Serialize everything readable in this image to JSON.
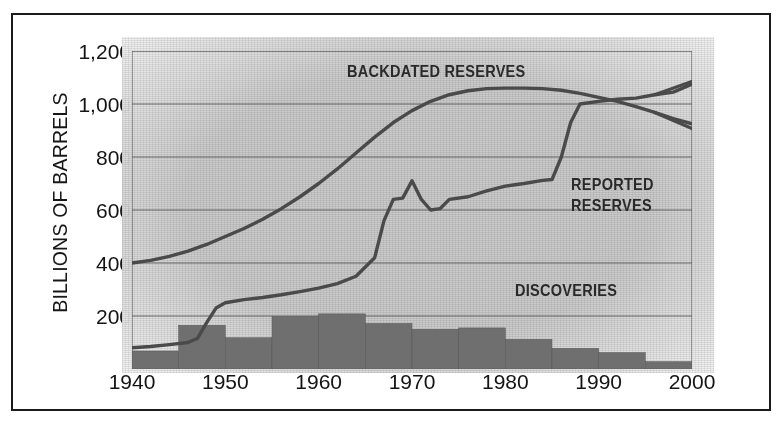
{
  "chart_data": {
    "type": "line",
    "title": "",
    "xlabel": "",
    "ylabel": "BILLIONS OF BARRELS",
    "xlim": [
      1940,
      2000
    ],
    "ylim": [
      0,
      1200
    ],
    "grid": true,
    "legend_position": "inline-annotations",
    "y_ticks": [
      {
        "value": 1200,
        "label": "1,200"
      },
      {
        "value": 1000,
        "label": "1,000"
      },
      {
        "value": 800,
        "label": "800"
      },
      {
        "value": 600,
        "label": "600"
      },
      {
        "value": 400,
        "label": "400"
      },
      {
        "value": 200,
        "label": "200"
      }
    ],
    "x_ticks": [
      {
        "value": 1940,
        "label": "1940"
      },
      {
        "value": 1950,
        "label": "1950"
      },
      {
        "value": 1960,
        "label": "1960"
      },
      {
        "value": 1970,
        "label": "1970"
      },
      {
        "value": 1980,
        "label": "1980"
      },
      {
        "value": 1990,
        "label": "1990"
      },
      {
        "value": 2000,
        "label": "2000"
      }
    ],
    "annotations": [
      {
        "name": "backdated-reserves-label",
        "text": "BACKDATED RESERVES",
        "x": 1963,
        "y": 1125
      },
      {
        "name": "reported-reserves-label-line1",
        "text": "REPORTED",
        "x": 1987,
        "y": 700
      },
      {
        "name": "reported-reserves-label-line2",
        "text": "RESERVES",
        "x": 1987,
        "y": 620
      },
      {
        "name": "discoveries-label",
        "text": "DISCOVERIES",
        "x": 1981,
        "y": 300
      }
    ],
    "series": [
      {
        "name": "BACKDATED RESERVES",
        "type": "line",
        "color": "#4a4a4a",
        "end_marker": "down-arrow",
        "x": [
          1940,
          1942,
          1944,
          1946,
          1948,
          1950,
          1952,
          1954,
          1956,
          1958,
          1960,
          1962,
          1964,
          1966,
          1968,
          1970,
          1972,
          1974,
          1976,
          1978,
          1980,
          1982,
          1984,
          1986,
          1988,
          1990,
          1992,
          1994,
          1996,
          1998,
          2000
        ],
        "y": [
          400,
          410,
          425,
          445,
          470,
          500,
          530,
          565,
          605,
          650,
          700,
          755,
          815,
          875,
          930,
          975,
          1010,
          1035,
          1050,
          1058,
          1060,
          1060,
          1058,
          1052,
          1040,
          1025,
          1010,
          990,
          968,
          945,
          925
        ]
      },
      {
        "name": "REPORTED RESERVES",
        "type": "line",
        "color": "#4a4a4a",
        "end_marker": "up-arrow",
        "x": [
          1940,
          1942,
          1944,
          1946,
          1947,
          1948,
          1949,
          1950,
          1952,
          1954,
          1956,
          1958,
          1960,
          1962,
          1964,
          1966,
          1967,
          1968,
          1969,
          1970,
          1971,
          1972,
          1973,
          1974,
          1976,
          1978,
          1980,
          1982,
          1984,
          1985,
          1986,
          1987,
          1988,
          1990,
          1992,
          1994,
          1996,
          1998,
          2000
        ],
        "y": [
          80,
          85,
          92,
          100,
          115,
          175,
          230,
          250,
          262,
          270,
          280,
          292,
          305,
          322,
          350,
          420,
          560,
          640,
          645,
          710,
          640,
          600,
          605,
          640,
          650,
          672,
          690,
          700,
          712,
          715,
          800,
          930,
          1000,
          1010,
          1018,
          1022,
          1035,
          1045,
          1075
        ]
      }
    ],
    "bars": {
      "name": "DISCOVERIES",
      "type": "bar",
      "color": "#6f6f6f",
      "bin_width_years": 5,
      "bins": [
        {
          "start": 1940,
          "end": 1945,
          "value": 68
        },
        {
          "start": 1945,
          "end": 1950,
          "value": 165
        },
        {
          "start": 1950,
          "end": 1955,
          "value": 118
        },
        {
          "start": 1955,
          "end": 1960,
          "value": 198
        },
        {
          "start": 1960,
          "end": 1965,
          "value": 208
        },
        {
          "start": 1965,
          "end": 1970,
          "value": 172
        },
        {
          "start": 1970,
          "end": 1975,
          "value": 150
        },
        {
          "start": 1975,
          "end": 1980,
          "value": 155
        },
        {
          "start": 1980,
          "end": 1985,
          "value": 112
        },
        {
          "start": 1985,
          "end": 1990,
          "value": 78
        },
        {
          "start": 1990,
          "end": 1995,
          "value": 62
        },
        {
          "start": 1995,
          "end": 2000,
          "value": 28
        }
      ]
    }
  },
  "colors": {
    "plot_background": "#c9c9c9",
    "line": "#4a4a4a",
    "bar": "#6f6f6f",
    "grid": "#5a5a5a",
    "frame": "#1b1b1b",
    "text": "#141414"
  }
}
